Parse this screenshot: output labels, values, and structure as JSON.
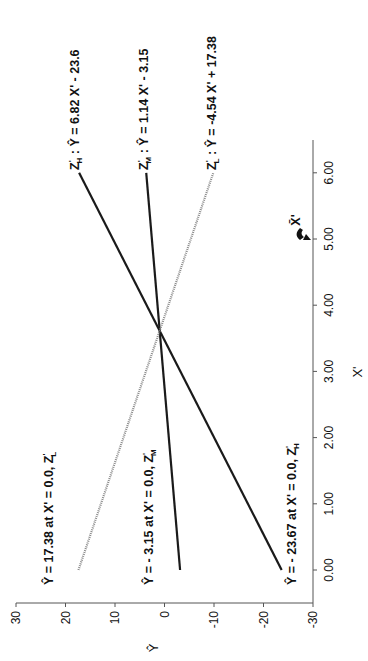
{
  "chart_data": {
    "type": "line",
    "orientation": "rotated-90-ccw",
    "title": "",
    "xlabel": "X'",
    "ylabel": "Ŷ",
    "xlim": [
      0,
      6
    ],
    "ylim": [
      -30,
      30
    ],
    "x_ticks": [
      "0.00",
      "1.00",
      "2.00",
      "3.00",
      "4.00",
      "5.00",
      "6.00"
    ],
    "y_ticks": [
      "30",
      "20",
      "10",
      "0",
      "-10",
      "-20",
      "-30"
    ],
    "grid": false,
    "mean_marker": {
      "label": "X̄'",
      "x": 5.0
    },
    "series": [
      {
        "name": "Z'H",
        "equation": "Z'H : Ŷ = 6.82 X' - 23.6",
        "slope": 6.82,
        "intercept": -23.67,
        "x": [
          0,
          6
        ],
        "values": [
          -23.67,
          17.25
        ],
        "style": "solid-dark",
        "intercept_label": "Ŷ = - 23.67 at X' = 0.0, Z'H"
      },
      {
        "name": "Z'M",
        "equation": "Z'M : Ŷ = 1.14 X' - 3.15",
        "slope": 1.14,
        "intercept": -3.15,
        "x": [
          0,
          6
        ],
        "values": [
          -3.15,
          3.69
        ],
        "style": "solid-dark",
        "intercept_label": "Ŷ = - 3.15 at X' = 0.0, Z'M"
      },
      {
        "name": "Z'L",
        "equation": "Z'L : Ŷ = -4.54 X' + 17.38",
        "slope": -4.54,
        "intercept": 17.38,
        "x": [
          0,
          6
        ],
        "values": [
          17.38,
          -9.86
        ],
        "style": "dotted-gray",
        "intercept_label": "Ŷ = 17.38 at X' = 0.0, Z'L"
      }
    ],
    "intersection": {
      "x": 3.6,
      "y": 0.95
    }
  },
  "labels": {
    "eq_h": {
      "z": "Z",
      "sup": "'",
      "sub": "H",
      "rest": " : Ŷ = 6.82 X' - 23.6"
    },
    "eq_m": {
      "z": "Z",
      "sup": "'",
      "sub": "M",
      "rest": " : Ŷ = 1.14 X' - 3.15"
    },
    "eq_l": {
      "z": "Z",
      "sup": "'",
      "sub": "L",
      "rest": " : Ŷ = -4.54 X' + 17.38"
    },
    "int_l": {
      "text": "Ŷ = 17.38  at  X' = 0.0, Z",
      "sup": "'",
      "sub": "L"
    },
    "int_m": {
      "text": "Ŷ = - 3.15  at  X' = 0.0, Z",
      "sup": "'",
      "sub": "M"
    },
    "int_h": {
      "text": "Ŷ = - 23.67  at  X' = 0.0, Z",
      "sup": "'",
      "sub": "H"
    },
    "xbar": "X̄'",
    "x_axis_title": "X'",
    "y_axis_title": "Ŷ"
  },
  "colors": {
    "dark_line": "#1a1a1a",
    "light_line": "#8a8a8a",
    "axis": "#555555"
  }
}
